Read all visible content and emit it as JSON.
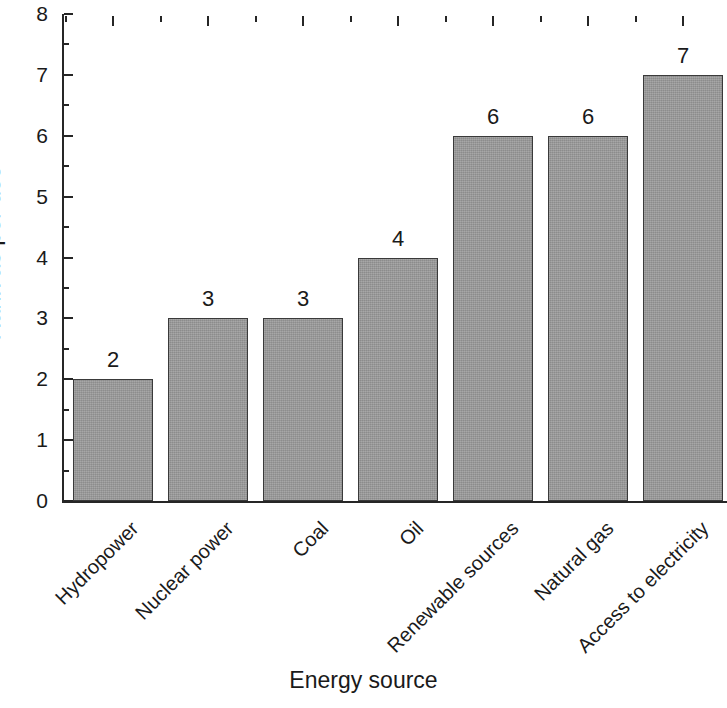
{
  "chart_data": {
    "type": "bar",
    "title": "",
    "xlabel": "Energy source",
    "ylabel": "Rank as per use",
    "categories": [
      "Hydropower",
      "Nuclear power",
      "Coal",
      "Oil",
      "Renewable sources",
      "Natural gas",
      "Access to electricity"
    ],
    "values": [
      2,
      3,
      3,
      4,
      6,
      6,
      7
    ],
    "value_labels": [
      "2",
      "3",
      "3",
      "4",
      "6",
      "6",
      "7"
    ],
    "ylim": [
      0,
      8
    ],
    "ytick_labels": [
      "0",
      "1",
      "2",
      "3",
      "4",
      "5",
      "6",
      "7",
      "8"
    ],
    "ytick_values": [
      0,
      1,
      2,
      3,
      4,
      5,
      6,
      7,
      8
    ],
    "yminor_step": 0.5,
    "grid": false,
    "legend": null,
    "bar_color": "#9a9a9a",
    "bar_edge_color": "#3a3a3a",
    "axis_color": "#262626",
    "background": "#ffffff",
    "label_rotation_deg": -45
  }
}
